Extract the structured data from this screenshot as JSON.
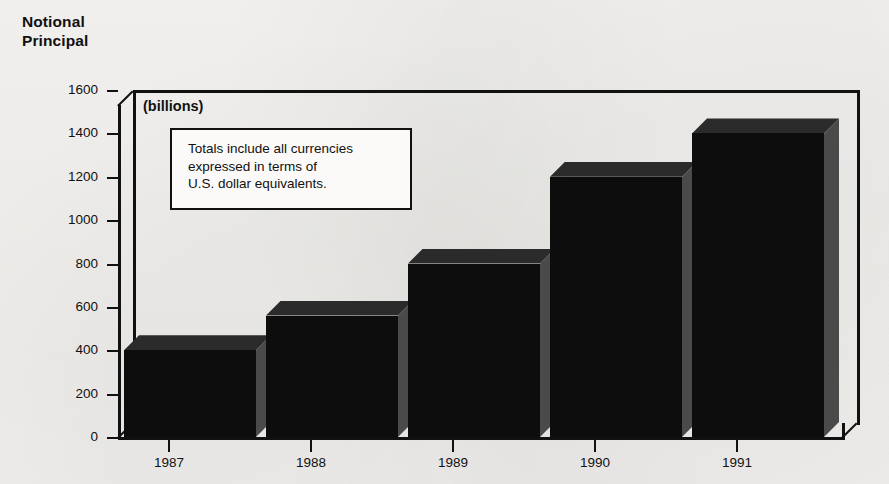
{
  "title": {
    "line1": "Notional",
    "line2": "Principal"
  },
  "units_label": "(billions)",
  "note": {
    "line1": "Totals include all currencies",
    "line2": "expressed in terms of",
    "line3": "U.S. dollar equivalents."
  },
  "colors": {
    "bar_face": "#0d0d0d",
    "bar_top": "#2b2b2b",
    "bar_side": "#4a4a4a",
    "axis": "#111111",
    "background": "#f4f3f1",
    "note_box_bg": "#fbfaf8"
  },
  "chart_data": {
    "type": "bar",
    "title": "Notional Principal",
    "subtitle": "(billions)",
    "annotation": "Totals include all currencies expressed in terms of U.S. dollar equivalents.",
    "categories": [
      "1987",
      "1988",
      "1989",
      "1990",
      "1991"
    ],
    "values": [
      400,
      560,
      800,
      1200,
      1400
    ],
    "xlabel": "",
    "ylabel": "Notional Principal",
    "ylim": [
      0,
      1600
    ],
    "ytick_labels": [
      "0",
      "200",
      "400",
      "600",
      "800",
      "1000",
      "1200",
      "1400",
      "1600"
    ],
    "ytick_values": [
      0,
      200,
      400,
      600,
      800,
      1000,
      1200,
      1400,
      1600
    ],
    "xtick_labels": [
      "1987",
      "1988",
      "1989",
      "1990",
      "1991"
    ],
    "grid": false,
    "legend": "none",
    "style": "3d-bar"
  }
}
